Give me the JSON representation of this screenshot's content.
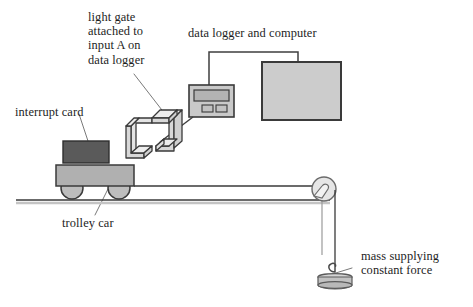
{
  "diagram": {
    "type": "physics-apparatus-diagram",
    "labels": {
      "light_gate": "light gate\nattached to\ninput A on\ndata logger",
      "light_gate_lines": [
        "light gate",
        "attached to",
        "input A on",
        "data logger"
      ],
      "data_logger": "data logger and computer",
      "interrupt_card": "interrupt card",
      "trolley_car": "trolley car",
      "mass": "mass supplying\nconstant force",
      "mass_lines": [
        "mass supplying",
        "constant force"
      ]
    },
    "components": {
      "interrupt_card": "interrupt-card",
      "trolley_body": "trolley-body",
      "wheel_rear": "trolley-wheel-rear",
      "wheel_front": "trolley-wheel-front",
      "light_gate": "light-gate-bracket",
      "data_logger": "data-logger-unit",
      "data_logger_display": "data-logger-display",
      "data_logger_button_left": "data-logger-button-left",
      "data_logger_button_right": "data-logger-button-right",
      "computer": "computer-monitor",
      "connector_cable": "data-logger-computer-cable",
      "gate_cable": "light-gate-to-logger-cable",
      "table": "table-surface",
      "string": "connecting-string",
      "pulley": "pulley-wheel",
      "hook": "mass-hook",
      "hanging_mass": "hanging-mass-disc"
    },
    "colors": {
      "interrupt_card_fill": "#5a5a5a",
      "trolley_fill": "#b0b0b0",
      "wheel_fill": "#bdbdbd",
      "device_fill": "#c9c9c9",
      "computer_fill": "#cccccc",
      "display_fill": "#b5b5b5",
      "outline": "#3a3a3a",
      "line": "#4a4a4a",
      "text": "#1d1d1d",
      "background": "#ffffff"
    }
  }
}
